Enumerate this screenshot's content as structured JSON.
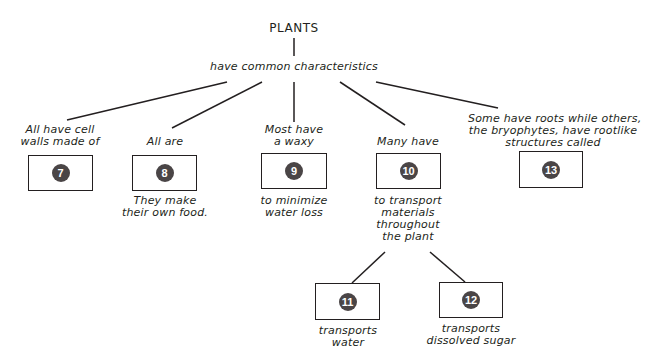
{
  "root": {
    "title": "PLANTS",
    "link": "have common characteristics"
  },
  "branches": [
    {
      "label": "All have cell walls made of",
      "label_lines": [
        "All have cell",
        "walls made of"
      ],
      "box": "7",
      "below": []
    },
    {
      "label": "All are",
      "label_lines": [
        "All are"
      ],
      "box": "8",
      "below": [
        "They make",
        "their own food."
      ]
    },
    {
      "label": "Most have a waxy",
      "label_lines": [
        "Most have",
        "a waxy"
      ],
      "box": "9",
      "below": [
        "to minimize",
        "water loss"
      ]
    },
    {
      "label": "Many have",
      "label_lines": [
        "Many have"
      ],
      "box": "10",
      "below": [
        "to transport",
        "materials",
        "throughout",
        "the plant"
      ]
    },
    {
      "label": "Some have roots while others, the bryophytes, have rootlike structures called",
      "label_lines": [
        "Some have roots while others,",
        "the bryophytes, have rootlike",
        "structures called"
      ],
      "box": "13",
      "below": []
    }
  ],
  "sub_branches": [
    {
      "box": "11",
      "below": [
        "transports",
        "water"
      ]
    },
    {
      "box": "12",
      "below": [
        "transports",
        "dissolved sugar"
      ]
    }
  ],
  "colors": {
    "ink": "#231f20",
    "badge": "#4a4546"
  }
}
